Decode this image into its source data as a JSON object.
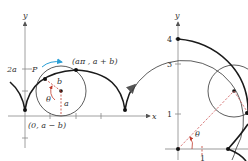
{
  "left_figure": {
    "y_axis_label": "y",
    "x_axis_label": "x",
    "tick_label_2a": "2a",
    "point_P_label": "P",
    "point_top_label": "(aπ , a + b)",
    "point_origin_label": "(0, a − b)",
    "radius_b_label": "b",
    "radius_a_label": "a",
    "angle_label": "θ",
    "colors": {
      "curve": "#1a1a1a",
      "circle": "#333333",
      "arrow": "#2a9fd6",
      "dashed": "#c0392b"
    }
  },
  "right_figure": {
    "y_axis_label": "y",
    "tick_labels_y": [
      "4",
      "3",
      "1"
    ],
    "tick_label_x": "1",
    "angle_label": "θ",
    "colors": {
      "curve": "#1a1a1a",
      "circle": "#333333",
      "dashed": "#d06060"
    }
  }
}
